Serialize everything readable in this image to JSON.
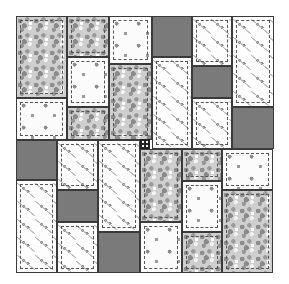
{
  "figure": {
    "title": "Pinwheel rectangle quilt layout",
    "fabrics": {
      "gray-floral": {
        "label": "Gray floral print",
        "color": "#cfcfcf"
      },
      "white-floral": {
        "label": "White floral print",
        "color": "#fbfbfb"
      },
      "white-branch": {
        "label": "White branch print",
        "color": "#fdfdfd"
      },
      "dark-solid": {
        "label": "Dark gray solid",
        "color": "#7a7a7a"
      }
    },
    "bounds": {
      "left": 16,
      "top": 16,
      "right": 274,
      "bottom": 273
    },
    "patches": [
      {
        "q": "top-left",
        "x": 16,
        "y": 16,
        "w": 51,
        "h": 82,
        "fabric": "gray-floral"
      },
      {
        "q": "top-left",
        "x": 16,
        "y": 98,
        "w": 51,
        "h": 42,
        "fabric": "white-floral"
      },
      {
        "q": "top-left",
        "x": 67,
        "y": 16,
        "w": 42,
        "h": 41,
        "fabric": "gray-floral"
      },
      {
        "q": "top-left",
        "x": 67,
        "y": 57,
        "w": 42,
        "h": 50,
        "fabric": "white-floral"
      },
      {
        "q": "top-left",
        "x": 67,
        "y": 107,
        "w": 42,
        "h": 33,
        "fabric": "gray-floral"
      },
      {
        "q": "top-left",
        "x": 109,
        "y": 16,
        "w": 43,
        "h": 48,
        "fabric": "white-floral"
      },
      {
        "q": "top-left",
        "x": 109,
        "y": 64,
        "w": 43,
        "h": 76,
        "fabric": "gray-floral"
      },
      {
        "q": "top-right",
        "x": 152,
        "y": 16,
        "w": 40,
        "h": 41,
        "fabric": "dark-solid"
      },
      {
        "q": "top-right",
        "x": 152,
        "y": 57,
        "w": 40,
        "h": 92,
        "fabric": "white-branch"
      },
      {
        "q": "top-right",
        "x": 192,
        "y": 16,
        "w": 40,
        "h": 50,
        "fabric": "white-branch"
      },
      {
        "q": "top-right",
        "x": 192,
        "y": 66,
        "w": 40,
        "h": 32,
        "fabric": "dark-solid"
      },
      {
        "q": "top-right",
        "x": 192,
        "y": 98,
        "w": 40,
        "h": 51,
        "fabric": "white-branch"
      },
      {
        "q": "top-right",
        "x": 232,
        "y": 16,
        "w": 42,
        "h": 91,
        "fabric": "white-branch"
      },
      {
        "q": "top-right",
        "x": 232,
        "y": 107,
        "w": 42,
        "h": 42,
        "fabric": "dark-solid"
      },
      {
        "q": "bottom-left",
        "x": 16,
        "y": 140,
        "w": 41,
        "h": 40,
        "fabric": "dark-solid"
      },
      {
        "q": "bottom-left",
        "x": 16,
        "y": 180,
        "w": 41,
        "h": 93,
        "fabric": "white-branch"
      },
      {
        "q": "bottom-left",
        "x": 57,
        "y": 140,
        "w": 41,
        "h": 50,
        "fabric": "white-branch"
      },
      {
        "q": "bottom-left",
        "x": 57,
        "y": 190,
        "w": 41,
        "h": 32,
        "fabric": "dark-solid"
      },
      {
        "q": "bottom-left",
        "x": 57,
        "y": 222,
        "w": 41,
        "h": 51,
        "fabric": "white-branch"
      },
      {
        "q": "bottom-left",
        "x": 98,
        "y": 140,
        "w": 42,
        "h": 92,
        "fabric": "white-branch"
      },
      {
        "q": "bottom-left",
        "x": 98,
        "y": 232,
        "w": 42,
        "h": 41,
        "fabric": "dark-solid"
      },
      {
        "q": "bottom-right",
        "x": 140,
        "y": 149,
        "w": 42,
        "h": 73,
        "fabric": "gray-floral"
      },
      {
        "q": "bottom-right",
        "x": 140,
        "y": 222,
        "w": 42,
        "h": 51,
        "fabric": "white-floral"
      },
      {
        "q": "bottom-right",
        "x": 182,
        "y": 149,
        "w": 40,
        "h": 32,
        "fabric": "gray-floral"
      },
      {
        "q": "bottom-right",
        "x": 182,
        "y": 181,
        "w": 40,
        "h": 51,
        "fabric": "white-floral"
      },
      {
        "q": "bottom-right",
        "x": 182,
        "y": 232,
        "w": 40,
        "h": 41,
        "fabric": "gray-floral"
      },
      {
        "q": "bottom-right",
        "x": 222,
        "y": 149,
        "w": 51,
        "h": 41,
        "fabric": "white-floral"
      },
      {
        "q": "bottom-right",
        "x": 222,
        "y": 190,
        "w": 51,
        "h": 83,
        "fabric": "gray-floral"
      }
    ]
  }
}
